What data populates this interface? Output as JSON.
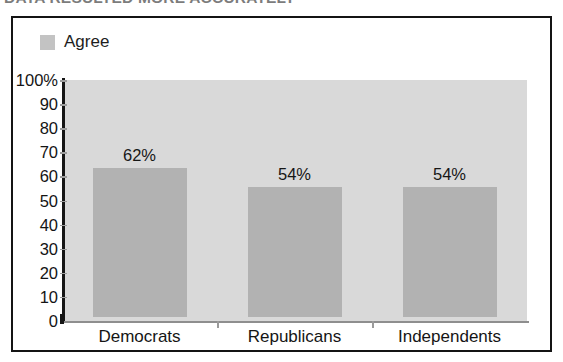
{
  "headline": {
    "text": "DATA RESULTED MORE ACCURATELY"
  },
  "legend": {
    "label": "Agree",
    "swatch_color": "#c3c3c3",
    "position": "top-left"
  },
  "colors": {
    "bar_fill": "#b2b2b2",
    "band": "#d9d9d9",
    "frame": "#141414",
    "axis": "#161616",
    "text": "#151515",
    "background": "#ffffff"
  },
  "chart_data": {
    "type": "bar",
    "title": "",
    "xlabel": "",
    "ylabel": "",
    "categories": [
      "Democrats",
      "Republicans",
      "Independents"
    ],
    "values": [
      62,
      54,
      54
    ],
    "data_labels": [
      "62%",
      "54%",
      "54%"
    ],
    "series": [
      {
        "name": "Agree",
        "values": [
          62,
          54,
          54
        ]
      }
    ],
    "ylim": [
      0,
      100
    ],
    "ytick_values": [
      0,
      10,
      20,
      30,
      40,
      50,
      60,
      70,
      80,
      90,
      100
    ],
    "ytick_labels": [
      "0",
      "10",
      "20",
      "30",
      "40",
      "50",
      "60",
      "70",
      "80",
      "90",
      "100%"
    ],
    "grid": false,
    "alternating_bands": true,
    "legend_position": "top-left",
    "legend_entries": [
      "Agree"
    ]
  }
}
